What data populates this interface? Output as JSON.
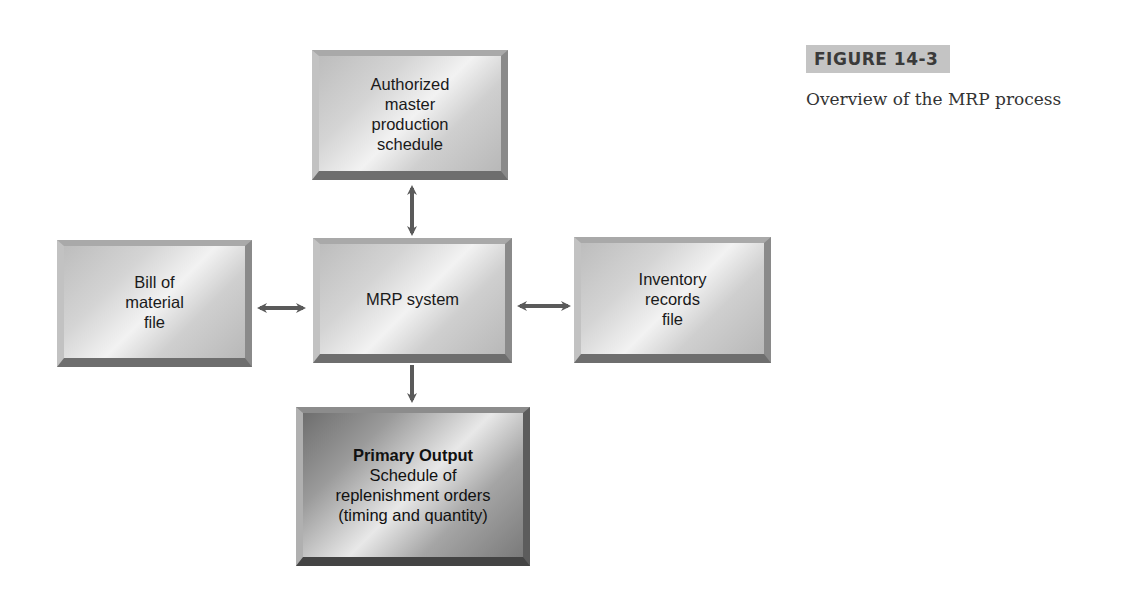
{
  "figure": {
    "label": "FIGURE 14-3",
    "caption": "Overview of the MRP process"
  },
  "diagram": {
    "nodes": {
      "mps": {
        "lines": [
          "Authorized",
          "master",
          "production",
          "schedule"
        ]
      },
      "mrp": {
        "lines": [
          "MRP system"
        ]
      },
      "bom": {
        "lines": [
          "Bill of",
          "material",
          "file"
        ]
      },
      "inventory": {
        "lines": [
          "Inventory",
          "records",
          "file"
        ]
      },
      "output": {
        "title": "Primary Output",
        "lines": [
          "Schedule of",
          "replenishment orders",
          "(timing and quantity)"
        ]
      }
    },
    "edges": [
      {
        "from": "mps",
        "to": "mrp",
        "type": "bidirectional"
      },
      {
        "from": "bom",
        "to": "mrp",
        "type": "bidirectional"
      },
      {
        "from": "mrp",
        "to": "inventory",
        "type": "bidirectional"
      },
      {
        "from": "mrp",
        "to": "output",
        "type": "directed"
      }
    ],
    "colors": {
      "arrow": "#5a5a5a",
      "label_bg": "#c4c4c4"
    }
  }
}
